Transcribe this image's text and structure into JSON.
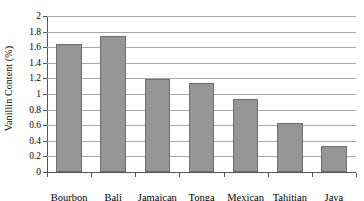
{
  "chart_data": {
    "type": "bar",
    "title": "",
    "xlabel": "",
    "ylabel": "Vanillin Content (%)",
    "categories": [
      "Bourbon",
      "Bali",
      "Jamaican",
      "Tonga",
      "Mexican",
      "Tahitian",
      "Java"
    ],
    "values": [
      1.64,
      1.75,
      1.19,
      1.14,
      0.94,
      0.63,
      0.33
    ],
    "ylim": [
      0,
      2
    ],
    "ytick_step": 0.2,
    "ytick_labels": [
      "0",
      "0.2",
      "0.4",
      "0.6",
      "0.8",
      "1",
      "1.2",
      "1.4",
      "1.6",
      "1.8",
      "2"
    ],
    "ytick_values": [
      0,
      0.2,
      0.4,
      0.6,
      0.8,
      1,
      1.2,
      1.4,
      1.6,
      1.8,
      2
    ],
    "grid": true,
    "grid_axis": "y",
    "legend": false,
    "legend_position": "none",
    "bar_color": "#969696",
    "bar_border_color": "#6e6e6e",
    "gridline_color": "#a8a8a8",
    "axis_color": "#555555",
    "background_color": "#ffffff"
  }
}
